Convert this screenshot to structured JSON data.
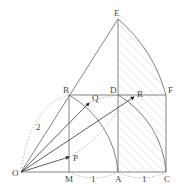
{
  "diagram": {
    "points": {
      "O": {
        "label": "O",
        "x": 21,
        "y": 172
      },
      "M": {
        "label": "M",
        "x": 69,
        "y": 172
      },
      "A": {
        "label": "A",
        "x": 118,
        "y": 172
      },
      "C": {
        "label": "C",
        "x": 166,
        "y": 172
      },
      "B": {
        "label": "B",
        "x": 69,
        "y": 95
      },
      "D": {
        "label": "D",
        "x": 118,
        "y": 95
      },
      "F": {
        "label": "F",
        "x": 166,
        "y": 95
      },
      "E": {
        "label": "E",
        "x": 118,
        "y": 19
      },
      "Q": {
        "label": "Q",
        "x": 89,
        "y": 103
      },
      "R": {
        "label": "R",
        "x": 134,
        "y": 97
      },
      "P": {
        "label": "P",
        "x": 69,
        "y": 157
      }
    },
    "measurements": {
      "OB": "2",
      "MA": "1",
      "AC": "1"
    },
    "colors": {
      "line": "#555555",
      "dashed": "#999999",
      "hatch": "#bbbbbb"
    }
  }
}
